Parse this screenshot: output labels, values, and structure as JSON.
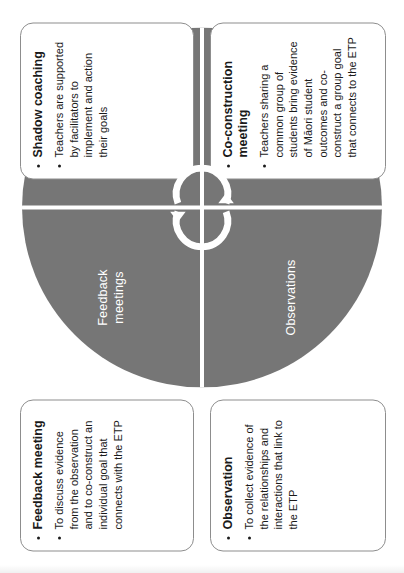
{
  "diagram": {
    "colors": {
      "wheel_fill": "#767676",
      "wheel_text": "#ffffff",
      "divider": "#ffffff",
      "box_border": "#8d8d8d",
      "box_text": "#1a1a1a",
      "page_background": "#ffffff"
    },
    "center_icon": "cycle-arrows-icon",
    "wheel": {
      "segments": [
        {
          "id": "feedback-meetings",
          "label": "Feedback\nmeetings",
          "position": "top-left"
        },
        {
          "id": "shadow-coaching",
          "label": "Shadow\ncoaching",
          "position": "top-right"
        },
        {
          "id": "observations",
          "label": "Observations",
          "position": "bottom-left"
        },
        {
          "id": "group-co-construction",
          "label": "Group\nco-construction\nmeetings",
          "position": "bottom-right"
        }
      ]
    },
    "callouts": [
      {
        "id": "feedback-meeting",
        "heading": "Feedback meeting",
        "body": "To discuss evidence from the observation and to co-construct an individual goal that connects with the ETP",
        "position": "top-left"
      },
      {
        "id": "shadow-coaching",
        "heading": "Shadow coaching",
        "body": "Teachers are supported by facilitators to implement and action their goals",
        "position": "top-right"
      },
      {
        "id": "observation",
        "heading": "Observation",
        "body": "To collect evidence of the relationships and interactions that link to the ETP",
        "position": "bottom-left"
      },
      {
        "id": "co-construction-meeting",
        "heading": "Co-construction meeting",
        "body": "Teachers sharing a common group of students bring evidence of Māori student outcomes and co-construct a group goal that connects to the ETP",
        "position": "bottom-right"
      }
    ]
  }
}
